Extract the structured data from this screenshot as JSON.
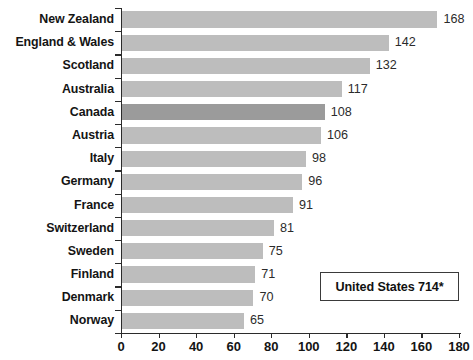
{
  "chart_data": {
    "type": "bar",
    "orientation": "horizontal",
    "title": "",
    "subtitle": "",
    "xlabel": "",
    "ylabel": "",
    "xlim": [
      0,
      180
    ],
    "xticks": [
      0,
      20,
      40,
      60,
      80,
      100,
      120,
      140,
      160,
      180
    ],
    "grid": false,
    "legend": false,
    "categories": [
      "New Zealand",
      "England & Wales",
      "Scotland",
      "Australia",
      "Canada",
      "Austria",
      "Italy",
      "Germany",
      "France",
      "Switzerland",
      "Sweden",
      "Finland",
      "Denmark",
      "Norway"
    ],
    "values": [
      168,
      142,
      132,
      117,
      108,
      106,
      98,
      96,
      91,
      81,
      75,
      71,
      70,
      65
    ],
    "highlight_category": "Canada",
    "bar_color": "#bdbdbd",
    "highlight_color": "#9b9b9b",
    "axis_color": "#2b2b2b",
    "text_color": "#141414",
    "annotations": [
      {
        "name": "united-states-callout",
        "text": "United States 714*"
      }
    ]
  },
  "axis": {
    "tick_labels": [
      "0",
      "20",
      "40",
      "60",
      "80",
      "100",
      "120",
      "140",
      "160",
      "180"
    ]
  },
  "callout": {
    "text": "United States 714*"
  }
}
